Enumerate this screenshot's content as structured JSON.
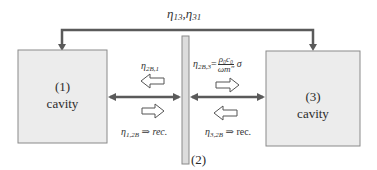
{
  "diagram": {
    "top_label": "η13, η31",
    "top_label_parts": {
      "sym": "η",
      "a": "13",
      "b": "31"
    },
    "cavity_1": {
      "number": "(1)",
      "label": "cavity"
    },
    "cavity_3": {
      "number": "(3)",
      "label": "cavity"
    },
    "partition": {
      "label": "(2)"
    },
    "left_upper": {
      "sym": "η",
      "sub": "2B,1"
    },
    "left_lower": {
      "sym": "η",
      "sub": "1,2B",
      "suffix": "⇒ rec."
    },
    "right_upper": {
      "sym": "η",
      "sub": "2B,3",
      "eq": "=",
      "num": "ρ₀c₀",
      "den": "ωm″",
      "tail": "σ"
    },
    "right_lower": {
      "sym": "η",
      "sub": "3,2B",
      "suffix": "⇒ rec."
    },
    "colors": {
      "line": "#5a5a5a",
      "box_fill": "#ececec",
      "box_border": "#8a8a8a",
      "partition_fill": "#dcdcdc",
      "hollow_arrow_stroke": "#555555"
    }
  }
}
